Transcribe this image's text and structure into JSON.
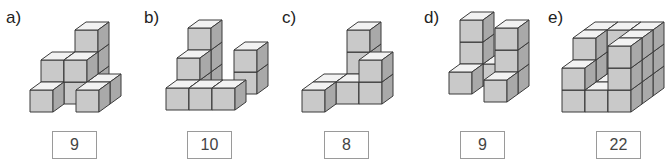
{
  "worksheet": {
    "task": "count-cubes",
    "colors": {
      "top": "#f2f2f2",
      "front": "#c9c9c9",
      "side": "#a9a9a9",
      "edge": "#3a3a3a"
    },
    "figures": [
      {
        "label": "a)",
        "answer": "9",
        "panel_x": 0,
        "label_x": 6,
        "answer_x": 52,
        "origin": [
          30,
          112
        ],
        "cubes": [
          [
            0,
            0,
            0
          ],
          [
            1,
            1,
            0
          ],
          [
            1,
            1,
            1
          ],
          [
            0,
            1,
            1
          ],
          [
            2,
            1,
            0
          ],
          [
            1,
            2,
            0
          ],
          [
            1,
            2,
            1
          ],
          [
            1,
            2,
            2
          ],
          [
            2,
            0,
            0
          ]
        ]
      },
      {
        "label": "b)",
        "answer": "10",
        "panel_x": 140,
        "label_x": 4,
        "answer_x": 47,
        "origin": [
          26,
          110
        ],
        "cubes": [
          [
            0,
            0,
            0
          ],
          [
            1,
            0,
            0
          ],
          [
            2,
            0,
            0
          ],
          [
            0,
            1,
            0
          ],
          [
            0,
            1,
            1
          ],
          [
            0,
            2,
            0
          ],
          [
            0,
            2,
            1
          ],
          [
            0,
            2,
            2
          ],
          [
            2,
            2,
            0
          ],
          [
            2,
            2,
            1
          ]
        ]
      },
      {
        "label": "c)",
        "answer": "8",
        "panel_x": 280,
        "label_x": 2,
        "answer_x": 44,
        "origin": [
          22,
          112
        ],
        "cubes": [
          [
            0,
            0,
            0
          ],
          [
            1,
            1,
            0
          ],
          [
            2,
            1,
            0
          ],
          [
            2,
            1,
            1
          ],
          [
            1,
            2,
            0
          ],
          [
            1,
            2,
            1
          ],
          [
            1,
            2,
            2
          ],
          [
            0,
            1,
            0
          ]
        ]
      },
      {
        "label": "d)",
        "answer": "9",
        "panel_x": 420,
        "label_x": 4,
        "answer_x": 40,
        "origin": [
          18,
          102
        ],
        "cubes": [
          [
            0,
            1,
            0
          ],
          [
            1,
            2,
            0
          ],
          [
            2,
            0,
            0
          ],
          [
            2,
            1,
            0
          ],
          [
            2,
            1,
            1
          ],
          [
            2,
            1,
            2
          ],
          [
            0,
            2,
            0
          ],
          [
            0,
            2,
            1
          ],
          [
            0,
            2,
            2
          ]
        ]
      },
      {
        "label": "e)",
        "answer": "22",
        "panel_x": 530,
        "label_x": 18,
        "answer_x": 66,
        "origin": [
          32,
          112
        ],
        "cubes": [
          [
            0,
            0,
            0
          ],
          [
            1,
            0,
            0
          ],
          [
            2,
            0,
            0
          ],
          [
            0,
            0,
            1
          ],
          [
            2,
            0,
            1
          ],
          [
            2,
            0,
            2
          ],
          [
            0,
            1,
            0
          ],
          [
            1,
            1,
            0
          ],
          [
            2,
            1,
            0
          ],
          [
            0,
            1,
            1
          ],
          [
            2,
            1,
            1
          ],
          [
            0,
            2,
            0
          ],
          [
            1,
            2,
            0
          ],
          [
            2,
            2,
            0
          ],
          [
            0,
            2,
            1
          ],
          [
            1,
            2,
            1
          ],
          [
            2,
            2,
            1
          ],
          [
            0,
            2,
            2
          ],
          [
            1,
            2,
            2
          ],
          [
            2,
            2,
            2
          ],
          [
            0,
            1,
            2
          ],
          [
            2,
            1,
            2
          ]
        ]
      }
    ]
  }
}
